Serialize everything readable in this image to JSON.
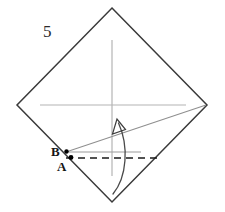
{
  "figure": {
    "width": 212,
    "height": 212,
    "background_color": "#ffffff",
    "step_number": "5",
    "step_number_position": {
      "x": 43,
      "y": 23
    }
  },
  "labels": {
    "point_b": "B",
    "point_a": "A"
  },
  "colors": {
    "paper_outline": "#3a3a3a",
    "crease_gray": "#9a9a9a",
    "axis_gray": "#b0b0b0",
    "fold_dashed": "#1a1a1a",
    "point_dot": "#000000",
    "arrow": "#4a4a4a",
    "text": "#222222"
  },
  "geometry": {
    "paper_diamond": {
      "name": "square-rotated-45",
      "top": {
        "x": 112,
        "y": 8
      },
      "right": {
        "x": 207,
        "y": 105
      },
      "bottom": {
        "x": 112,
        "y": 202
      },
      "left": {
        "x": 17,
        "y": 105
      },
      "stroke_width": 1.4
    },
    "axis_horizontal": {
      "x1": 40,
      "y1": 105,
      "x2": 186,
      "y2": 105
    },
    "axis_vertical": {
      "x1": 112,
      "y1": 40,
      "x2": 112,
      "y2": 176
    },
    "crease_diagonal": {
      "x1": 66,
      "y1": 152,
      "x2": 206,
      "y2": 105
    },
    "crease_horizontal_short": {
      "x1": 66,
      "y1": 152,
      "x2": 141,
      "y2": 152
    },
    "fold_dashed_line": {
      "x1": 66,
      "y1": 158,
      "x2": 161,
      "y2": 158,
      "dash": "7,5"
    },
    "point_b_dot": {
      "x": 66.5,
      "y": 151.5,
      "r": 2.1
    },
    "point_a_dot": {
      "x": 71,
      "y": 157.5,
      "r": 2.3
    },
    "point_b_label_position": {
      "x": 51,
      "y": 145
    },
    "point_a_label_position": {
      "x": 57,
      "y": 160
    },
    "fold_arrow": {
      "path": "M 113 194 C 126 178, 128 146, 118 122",
      "head_tip": {
        "x": 117,
        "y": 120
      },
      "head_left": {
        "x": 112,
        "y": 133
      },
      "head_right": {
        "x": 125,
        "y": 130
      }
    }
  }
}
